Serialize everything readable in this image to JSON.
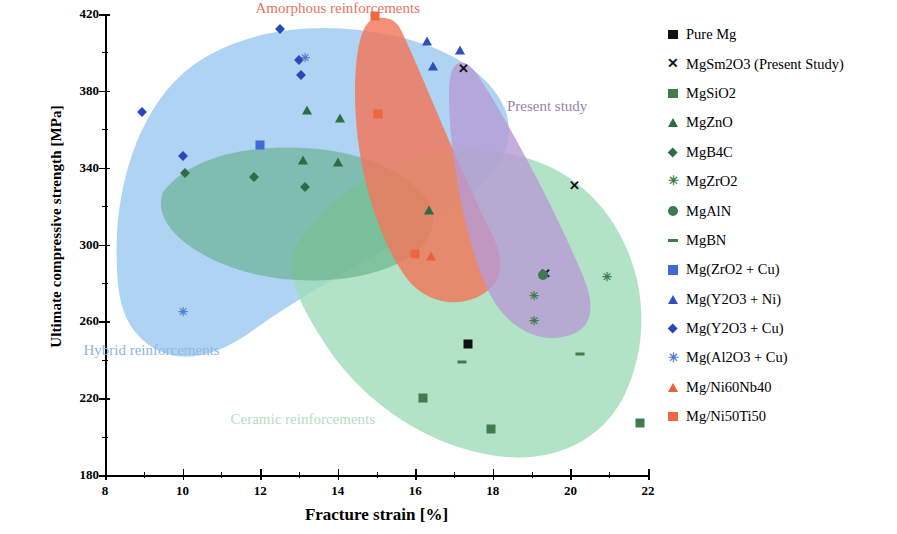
{
  "chart_data": {
    "type": "scatter",
    "title": "",
    "xlabel": "Fracture strain [%]",
    "ylabel": "Ultimate compressive strength [MPa]",
    "xlim": [
      8,
      22
    ],
    "ylim": [
      180,
      420
    ],
    "xticks": [
      8,
      10,
      12,
      14,
      16,
      18,
      20,
      22
    ],
    "xtick_labels": [
      "8",
      "10",
      "12",
      "14",
      "16",
      "18",
      "20",
      "22"
    ],
    "xminor_ticks": [
      9,
      11,
      13,
      15,
      17,
      19,
      21
    ],
    "yticks": [
      180,
      220,
      260,
      300,
      340,
      380,
      420
    ],
    "ytick_labels": [
      "180",
      "220",
      "260",
      "300",
      "340",
      "380",
      "420"
    ],
    "yminor_ticks": [
      200,
      240,
      280,
      320,
      360,
      400
    ],
    "grid": false,
    "legend_position": "right-outside",
    "annotations": [
      {
        "text": "Amorphous reinforcements",
        "x": 14.0,
        "y": 423,
        "color": "#e8745c"
      },
      {
        "text": "Hybrid reinforcements",
        "x": 9.2,
        "y": 245,
        "color": "#8fb6e0"
      },
      {
        "text": "Ceramic reinforcements",
        "x": 13.1,
        "y": 209,
        "color": "#b6ddc4"
      },
      {
        "text": "Present study",
        "x": 19.4,
        "y": 372,
        "color": "#9a7fb0"
      }
    ],
    "regions": [
      {
        "name": "Hybrid reinforcements",
        "color": "#9ecbf0",
        "opacity": 0.85
      },
      {
        "name": "Ceramic reinforcements",
        "color": "#9fdcb8",
        "opacity": 0.78
      },
      {
        "name": "Amorphous reinforcements",
        "color": "#f2765a",
        "opacity": 0.85
      },
      {
        "name": "Present study",
        "color": "#b79ad4",
        "opacity": 0.82
      }
    ],
    "series": [
      {
        "name": "Pure Mg",
        "marker": "square",
        "color": "#111111",
        "points": [
          [
            17.35,
            248
          ]
        ]
      },
      {
        "name": "MgSm2O3 (Present Study)",
        "marker": "x",
        "color": "#111111",
        "points": [
          [
            17.25,
            392
          ],
          [
            20.1,
            331
          ],
          [
            19.35,
            285
          ]
        ]
      },
      {
        "name": "MgSiO2",
        "marker": "square",
        "color": "#3f7d4f",
        "points": [
          [
            16.2,
            220
          ],
          [
            17.95,
            204
          ],
          [
            21.8,
            207
          ]
        ]
      },
      {
        "name": "MgZnO",
        "marker": "triangle",
        "color": "#2f6b44",
        "points": [
          [
            13.2,
            370
          ],
          [
            14.05,
            366
          ],
          [
            13.1,
            344
          ],
          [
            14.0,
            343
          ],
          [
            16.35,
            318
          ]
        ]
      },
      {
        "name": "MgB4C",
        "marker": "diamond",
        "color": "#2f6b44",
        "points": [
          [
            10.05,
            337
          ],
          [
            11.85,
            335
          ],
          [
            13.15,
            330
          ]
        ]
      },
      {
        "name": "MgZrO2",
        "marker": "star",
        "color": "#3f7d4f",
        "points": [
          [
            19.05,
            273
          ],
          [
            19.05,
            260
          ],
          [
            20.95,
            283
          ]
        ]
      },
      {
        "name": "MgAlN",
        "marker": "circle",
        "color": "#3d7a52",
        "points": [
          [
            19.3,
            284
          ]
        ]
      },
      {
        "name": "MgBN",
        "marker": "dash",
        "color": "#3f7d4f",
        "points": [
          [
            17.2,
            239
          ],
          [
            20.25,
            243
          ]
        ]
      },
      {
        "name": "Mg(ZrO2 + Cu)",
        "marker": "square",
        "color": "#4169d6",
        "points": [
          [
            12.0,
            352
          ]
        ]
      },
      {
        "name": "Mg(Y2O3 + Ni)",
        "marker": "triangle",
        "color": "#2f4fc0",
        "points": [
          [
            16.3,
            406
          ],
          [
            16.45,
            393
          ],
          [
            17.15,
            401
          ]
        ]
      },
      {
        "name": "Mg(Y2O3 + Cu)",
        "marker": "diamond",
        "color": "#2848b8",
        "points": [
          [
            8.95,
            369
          ],
          [
            10.0,
            346
          ],
          [
            12.5,
            412
          ],
          [
            13.0,
            396
          ],
          [
            13.05,
            388
          ]
        ]
      },
      {
        "name": "Mg(Al2O3 + Cu)",
        "marker": "star",
        "color": "#4f7fd0",
        "points": [
          [
            10.0,
            265
          ],
          [
            13.15,
            397
          ]
        ]
      },
      {
        "name": "Mg/Ni60Nb40",
        "marker": "triangle",
        "color": "#e8603c",
        "points": [
          [
            16.4,
            294
          ]
        ]
      },
      {
        "name": "Mg/Ni50Ti50",
        "marker": "square",
        "color": "#f0663f",
        "points": [
          [
            14.95,
            419
          ],
          [
            15.05,
            368
          ],
          [
            16.0,
            295
          ]
        ]
      }
    ]
  },
  "legend": {
    "items": [
      {
        "label": "Pure Mg",
        "marker": "square",
        "color": "#111111"
      },
      {
        "label": "MgSm2O3 (Present Study)",
        "marker": "x",
        "color": "#111111"
      },
      {
        "label": "MgSiO2",
        "marker": "square",
        "color": "#3f7d4f"
      },
      {
        "label": "MgZnO",
        "marker": "triangle",
        "color": "#2f6b44"
      },
      {
        "label": "MgB4C",
        "marker": "diamond",
        "color": "#2f6b44"
      },
      {
        "label": "MgZrO2",
        "marker": "star",
        "color": "#3f7d4f"
      },
      {
        "label": "MgAlN",
        "marker": "circle",
        "color": "#3d7a52"
      },
      {
        "label": "MgBN",
        "marker": "dash",
        "color": "#3f7d4f"
      },
      {
        "label": "Mg(ZrO2 + Cu)",
        "marker": "square",
        "color": "#4169d6"
      },
      {
        "label": "Mg(Y2O3 + Ni)",
        "marker": "triangle",
        "color": "#2f4fc0"
      },
      {
        "label": "Mg(Y2O3 + Cu)",
        "marker": "diamond",
        "color": "#2848b8"
      },
      {
        "label": "Mg(Al2O3 + Cu)",
        "marker": "star",
        "color": "#4f7fd0"
      },
      {
        "label": "Mg/Ni60Nb40",
        "marker": "triangle",
        "color": "#e8603c"
      },
      {
        "label": "Mg/Ni50Ti50",
        "marker": "square",
        "color": "#f0663f"
      }
    ]
  }
}
